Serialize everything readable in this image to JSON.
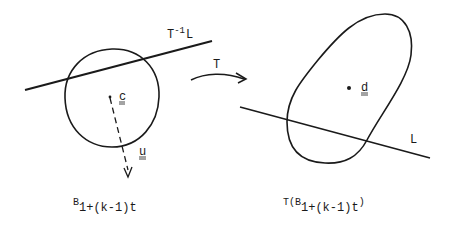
{
  "diagram": {
    "left_panel": {
      "ball_label": {
        "base": "B",
        "subscript": "1+(k-1)t"
      },
      "line_label": {
        "base": "T",
        "superscript": "-1",
        "suffix": "L"
      },
      "center_label": "c",
      "direction_label": "u"
    },
    "mapping": {
      "arrow_label": "T"
    },
    "right_panel": {
      "image_label": {
        "prefix": "T(B",
        "subscript": "1+(k-1)t",
        "suffix": ")"
      },
      "center_label": "d",
      "line_label": "L"
    },
    "colors": {
      "ink": "#1a1a1a",
      "background": "#ffffff"
    }
  }
}
